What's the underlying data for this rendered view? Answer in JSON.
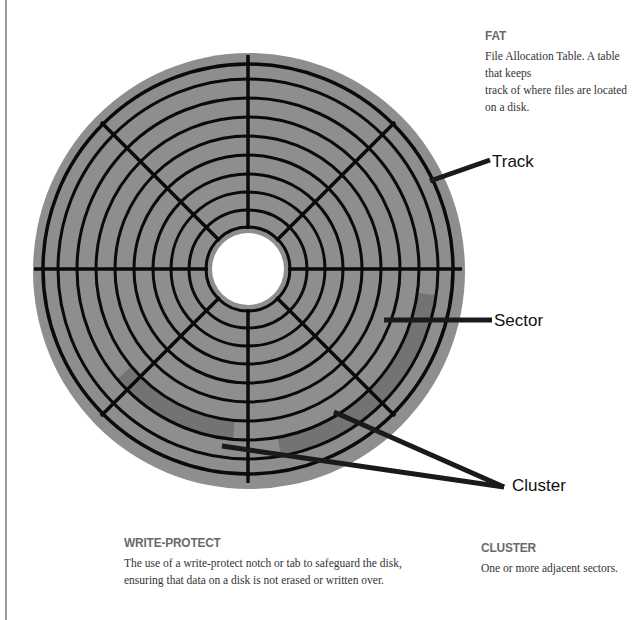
{
  "disk": {
    "center": [
      248,
      269
    ],
    "outer_radius": 216,
    "hole_radius": 36,
    "track_radii": [
      42,
      59,
      77,
      95,
      114,
      133,
      152,
      171,
      190,
      205
    ],
    "sector_angles_deg": [
      0,
      45,
      90,
      135,
      180,
      225,
      270,
      315
    ],
    "colors": {
      "platter": "#8e8e8e",
      "lines": "#0a0a0a",
      "hole": "#ffffff",
      "highlight": "#6e6e6e"
    }
  },
  "callouts": [
    {
      "id": "track",
      "label": "Track",
      "from": [
        430,
        181
      ],
      "to": [
        490,
        160
      ],
      "text_at": [
        492,
        167
      ]
    },
    {
      "id": "sector",
      "label": "Sector",
      "from": [
        384,
        320
      ],
      "to": [
        492,
        320
      ],
      "text_at": [
        494,
        326
      ]
    },
    {
      "id": "cluster",
      "label": "Cluster",
      "from": [
        [
          222,
          446
        ],
        [
          334,
          412
        ]
      ],
      "to": [
        504,
        487
      ],
      "text_at": [
        512,
        491
      ]
    }
  ],
  "terms": {
    "fat": {
      "heading": "FAT",
      "body_lines": [
        "File Allocation Table. A table that keeps",
        "track of where files are located on a disk."
      ]
    },
    "write_protect": {
      "heading": "WRITE-PROTECT",
      "body_lines": [
        "The use of a write-protect notch or tab to safeguard the disk,",
        "ensuring that data on a disk is not erased or written over."
      ]
    },
    "cluster": {
      "heading": "CLUSTER",
      "body_lines": [
        "One or more adjacent sectors."
      ]
    }
  }
}
